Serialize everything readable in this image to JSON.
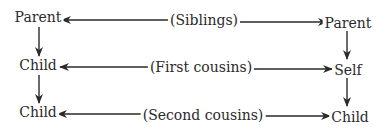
{
  "diagram": {
    "nodes": {
      "left_parent": "Parent",
      "left_child_1": "Child",
      "left_child_2": "Child",
      "right_parent": "Parent",
      "right_self": "Self",
      "right_child": "Child"
    },
    "edges": {
      "row1_label": "(Siblings)",
      "row2_label": "(First cousins)",
      "row3_label": "(Second cousins)"
    },
    "colors": {
      "line": "#2a2a2a",
      "text": "#2a2a2a",
      "background": "#ffffff"
    }
  }
}
